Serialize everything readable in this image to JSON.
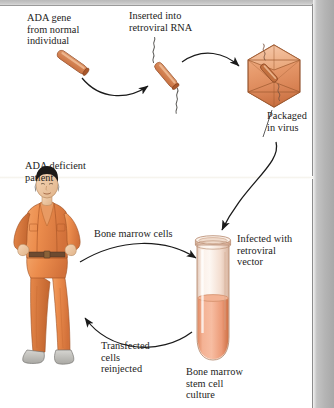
{
  "figure": {
    "palette": {
      "gene_orange": "#c2703f",
      "gene_highlight": "#e8a477",
      "gene_outline": "#7d3d1c",
      "capsid_fill": "#e79a6c",
      "capsid_outline": "#8c4a24",
      "tube_glass": "#f6e2d6",
      "tube_medium": "#ec9f7e",
      "jumpsuit_orange": "#e78a4e",
      "jumpsuit_shadow": "#c96b34",
      "skin": "#f0c9a5",
      "hair_black": "#1d1a18",
      "shoe_gray": "#b9b8b4",
      "arrow_black": "#1a1a1a",
      "text_black": "#1c1b1a",
      "page_gray": "#b5b5b5"
    },
    "labels": {
      "ada_gene": "ADA gene\nfrom normal\nindividual",
      "inserted_rna": "Inserted into\nretroviral RNA",
      "packaged_virus": "Packaged\nin virus",
      "ada_patient": "ADA deficient\npatient",
      "bone_marrow_cells": "Bone marrow cells",
      "infected_vector": "Infected with\nretroviral\nvector",
      "transfected_reinjected": "Transfected\ncells\nreinjected",
      "stem_cell_culture": "Bone marrow\nstem cell\nculture"
    },
    "steps": [
      {
        "n": 1,
        "label": "ADA gene\nfrom normal\nindividual",
        "element": "gene-rod"
      },
      {
        "n": 2,
        "label": "Inserted into\nretroviral RNA",
        "element": "gene-rod-with-rna"
      },
      {
        "n": 3,
        "label": "Packaged\nin virus",
        "element": "virus-capsid"
      },
      {
        "n": 4,
        "label": "Infected with\nretroviral\nvector",
        "element": "test-tube"
      },
      {
        "n": 5,
        "label": "Bone marrow\nstem cell\nculture",
        "element": "test-tube"
      },
      {
        "n": 6,
        "label": "Transfected\ncells\nreinjected",
        "element": "patient-figure"
      },
      {
        "n": 7,
        "label": "Bone marrow cells",
        "element": "patient-figure"
      },
      {
        "n": 8,
        "label": "ADA deficient\npatient",
        "element": "patient-figure"
      }
    ],
    "arrows": [
      {
        "name": "gene-to-rna",
        "from": "ada-gene-rod",
        "to": "retroviral-rna-construct"
      },
      {
        "name": "rna-to-virus",
        "from": "retroviral-rna-construct",
        "to": "virus-capsid"
      },
      {
        "name": "virus-to-tube",
        "from": "virus-capsid",
        "to": "test-tube"
      },
      {
        "name": "patient-to-tube",
        "from": "patient-figure",
        "to": "test-tube"
      },
      {
        "name": "tube-to-patient",
        "from": "test-tube",
        "to": "patient-figure"
      }
    ]
  }
}
